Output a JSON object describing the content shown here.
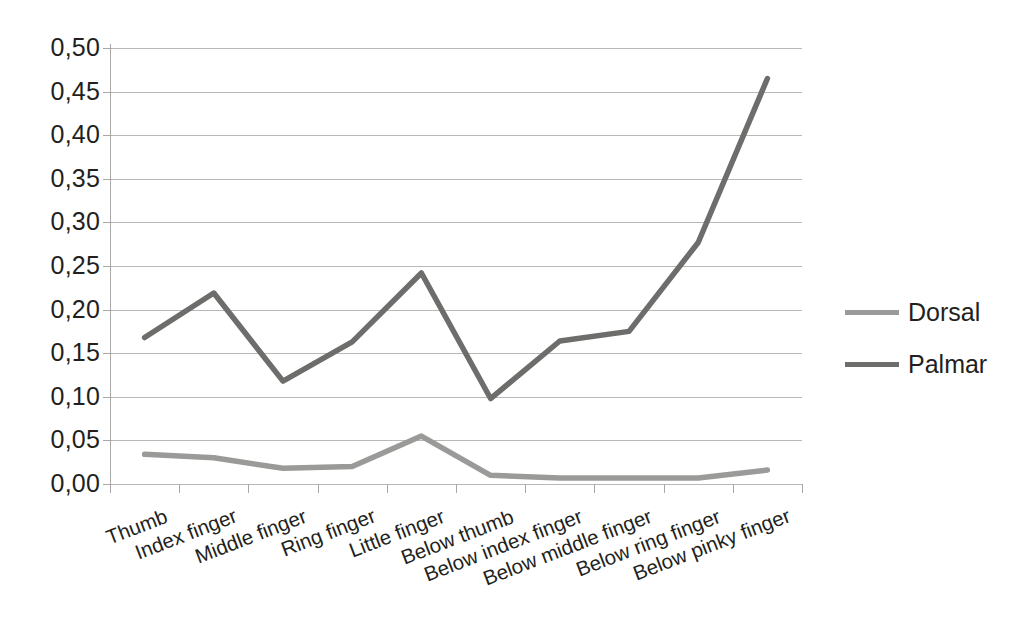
{
  "chart_data": {
    "type": "line",
    "title": "",
    "xlabel": "",
    "ylabel": "",
    "categories": [
      "Thumb",
      "Index finger",
      "Middle finger",
      "Ring finger",
      "Little finger",
      "Below thumb",
      "Below index finger",
      "Below middle finger",
      "Below ring finger",
      "Below pinky finger"
    ],
    "series": [
      {
        "name": "Dorsal",
        "color": "#9a9a98",
        "values": [
          0.034,
          0.03,
          0.018,
          0.02,
          0.055,
          0.01,
          0.007,
          0.007,
          0.007,
          0.016
        ]
      },
      {
        "name": "Palmar",
        "color": "#6d6d6b",
        "values": [
          0.168,
          0.219,
          0.118,
          0.163,
          0.242,
          0.098,
          0.164,
          0.175,
          0.277,
          0.465
        ]
      }
    ],
    "ylim": [
      0.0,
      0.5
    ],
    "y_ticks": [
      0.0,
      0.05,
      0.1,
      0.15,
      0.2,
      0.25,
      0.3,
      0.35,
      0.4,
      0.45,
      0.5
    ],
    "y_tick_labels": [
      "0,00",
      "0,05",
      "0,10",
      "0,15",
      "0,20",
      "0,25",
      "0,30",
      "0,35",
      "0,40",
      "0,45",
      "0,50"
    ],
    "grid": true,
    "grid_axis": "y",
    "legend_position": "right",
    "decimal_separator": ",",
    "background_color": "#ffffff",
    "grid_color": "#b9b8b6",
    "axis_color": "#a9a8a6",
    "text_color": "#231f20"
  },
  "legend": {
    "items": [
      {
        "label": "Dorsal",
        "color": "#9a9a98"
      },
      {
        "label": "Palmar",
        "color": "#6d6d6b"
      }
    ]
  }
}
